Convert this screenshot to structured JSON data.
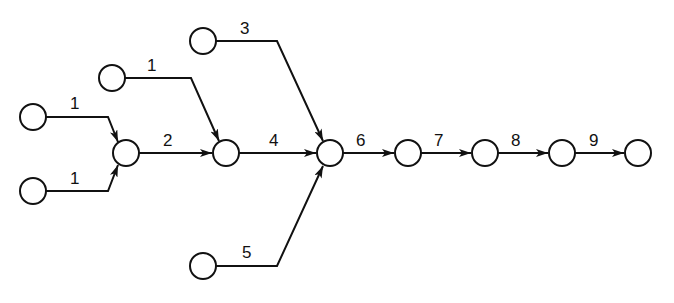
{
  "diagram": {
    "type": "network",
    "nodes": [
      {
        "id": "A",
        "x": 33,
        "y": 117
      },
      {
        "id": "B",
        "x": 33,
        "y": 191
      },
      {
        "id": "C",
        "x": 126,
        "y": 153
      },
      {
        "id": "D",
        "x": 112,
        "y": 78
      },
      {
        "id": "E",
        "x": 226,
        "y": 153
      },
      {
        "id": "F",
        "x": 203,
        "y": 41
      },
      {
        "id": "G",
        "x": 330,
        "y": 153
      },
      {
        "id": "H",
        "x": 203,
        "y": 266
      },
      {
        "id": "I",
        "x": 408,
        "y": 153
      },
      {
        "id": "J",
        "x": 485,
        "y": 153
      },
      {
        "id": "K",
        "x": 562,
        "y": 153
      },
      {
        "id": "L",
        "x": 638,
        "y": 153
      }
    ],
    "edges": [
      {
        "from": "A",
        "to": "C",
        "label": "1"
      },
      {
        "from": "B",
        "to": "C",
        "label": "1"
      },
      {
        "from": "C",
        "to": "E",
        "label": "2"
      },
      {
        "from": "D",
        "to": "E",
        "label": "1"
      },
      {
        "from": "E",
        "to": "G",
        "label": "4"
      },
      {
        "from": "F",
        "to": "G",
        "label": "3"
      },
      {
        "from": "H",
        "to": "G",
        "label": "5"
      },
      {
        "from": "G",
        "to": "I",
        "label": "6"
      },
      {
        "from": "I",
        "to": "J",
        "label": "7"
      },
      {
        "from": "J",
        "to": "K",
        "label": "8"
      },
      {
        "from": "K",
        "to": "L",
        "label": "9"
      }
    ]
  }
}
